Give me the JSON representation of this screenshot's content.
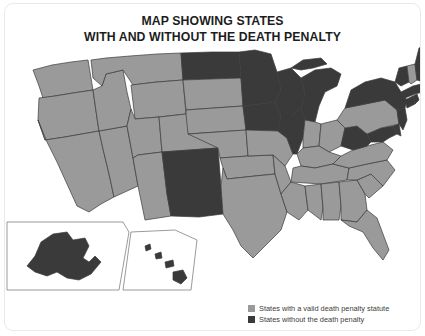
{
  "title": {
    "line1": "MAP SHOWING STATES",
    "line2": "WITH AND WITHOUT THE DEATH PENALTY"
  },
  "colors": {
    "with_penalty": "#9a9a9a",
    "without_penalty": "#3a3a3a",
    "border": "#3b3b3b",
    "background": "#ffffff",
    "card_border": "#e9e9ec",
    "text": "#1d1d1d",
    "legend_text": "#3c3c3c"
  },
  "legend": {
    "position": "bottom-right",
    "items": [
      {
        "swatch_color": "#9a9a9a",
        "label": "States with a valid death penalty statute",
        "category": "with_penalty"
      },
      {
        "swatch_color": "#3a3a3a",
        "label": "States without the death penalty",
        "category": "without_penalty"
      }
    ]
  },
  "chart_data": {
    "type": "map",
    "title": "MAP SHOWING STATES WITH AND WITHOUT THE DEATH PENALTY",
    "subtitle": "",
    "region": "United States",
    "projection": "albers-usa",
    "insets": [
      "Alaska",
      "Hawaii"
    ],
    "categories": [
      "States with a valid death penalty statute",
      "States without the death penalty"
    ],
    "category_colors": [
      "#9a9a9a",
      "#3a3a3a"
    ],
    "counts": {
      "with_penalty": 29,
      "without_penalty": 21
    },
    "states": [
      {
        "code": "AL",
        "name": "Alabama",
        "category": "with_penalty"
      },
      {
        "code": "AK",
        "name": "Alaska",
        "category": "without_penalty"
      },
      {
        "code": "AZ",
        "name": "Arizona",
        "category": "with_penalty"
      },
      {
        "code": "AR",
        "name": "Arkansas",
        "category": "with_penalty"
      },
      {
        "code": "CA",
        "name": "California",
        "category": "with_penalty"
      },
      {
        "code": "CO",
        "name": "Colorado",
        "category": "with_penalty"
      },
      {
        "code": "CT",
        "name": "Connecticut",
        "category": "without_penalty"
      },
      {
        "code": "DE",
        "name": "Delaware",
        "category": "without_penalty"
      },
      {
        "code": "FL",
        "name": "Florida",
        "category": "with_penalty"
      },
      {
        "code": "GA",
        "name": "Georgia",
        "category": "with_penalty"
      },
      {
        "code": "HI",
        "name": "Hawaii",
        "category": "without_penalty"
      },
      {
        "code": "ID",
        "name": "Idaho",
        "category": "with_penalty"
      },
      {
        "code": "IL",
        "name": "Illinois",
        "category": "without_penalty"
      },
      {
        "code": "IN",
        "name": "Indiana",
        "category": "with_penalty"
      },
      {
        "code": "IA",
        "name": "Iowa",
        "category": "without_penalty"
      },
      {
        "code": "KS",
        "name": "Kansas",
        "category": "with_penalty"
      },
      {
        "code": "KY",
        "name": "Kentucky",
        "category": "with_penalty"
      },
      {
        "code": "LA",
        "name": "Louisiana",
        "category": "with_penalty"
      },
      {
        "code": "ME",
        "name": "Maine",
        "category": "without_penalty"
      },
      {
        "code": "MD",
        "name": "Maryland",
        "category": "without_penalty"
      },
      {
        "code": "MA",
        "name": "Massachusetts",
        "category": "without_penalty"
      },
      {
        "code": "MI",
        "name": "Michigan",
        "category": "without_penalty"
      },
      {
        "code": "MN",
        "name": "Minnesota",
        "category": "without_penalty"
      },
      {
        "code": "MS",
        "name": "Mississippi",
        "category": "with_penalty"
      },
      {
        "code": "MO",
        "name": "Missouri",
        "category": "with_penalty"
      },
      {
        "code": "MT",
        "name": "Montana",
        "category": "with_penalty"
      },
      {
        "code": "NE",
        "name": "Nebraska",
        "category": "with_penalty"
      },
      {
        "code": "NV",
        "name": "Nevada",
        "category": "with_penalty"
      },
      {
        "code": "NH",
        "name": "New Hampshire",
        "category": "with_penalty"
      },
      {
        "code": "NJ",
        "name": "New Jersey",
        "category": "without_penalty"
      },
      {
        "code": "NM",
        "name": "New Mexico",
        "category": "without_penalty"
      },
      {
        "code": "NY",
        "name": "New York",
        "category": "without_penalty"
      },
      {
        "code": "NC",
        "name": "North Carolina",
        "category": "with_penalty"
      },
      {
        "code": "ND",
        "name": "North Dakota",
        "category": "without_penalty"
      },
      {
        "code": "OH",
        "name": "Ohio",
        "category": "with_penalty"
      },
      {
        "code": "OK",
        "name": "Oklahoma",
        "category": "with_penalty"
      },
      {
        "code": "OR",
        "name": "Oregon",
        "category": "with_penalty"
      },
      {
        "code": "PA",
        "name": "Pennsylvania",
        "category": "with_penalty"
      },
      {
        "code": "RI",
        "name": "Rhode Island",
        "category": "without_penalty"
      },
      {
        "code": "SC",
        "name": "South Carolina",
        "category": "with_penalty"
      },
      {
        "code": "SD",
        "name": "South Dakota",
        "category": "with_penalty"
      },
      {
        "code": "TN",
        "name": "Tennessee",
        "category": "with_penalty"
      },
      {
        "code": "TX",
        "name": "Texas",
        "category": "with_penalty"
      },
      {
        "code": "UT",
        "name": "Utah",
        "category": "with_penalty"
      },
      {
        "code": "VT",
        "name": "Vermont",
        "category": "without_penalty"
      },
      {
        "code": "VA",
        "name": "Virginia",
        "category": "with_penalty"
      },
      {
        "code": "WA",
        "name": "Washington",
        "category": "with_penalty"
      },
      {
        "code": "WV",
        "name": "West Virginia",
        "category": "without_penalty"
      },
      {
        "code": "WI",
        "name": "Wisconsin",
        "category": "without_penalty"
      },
      {
        "code": "WY",
        "name": "Wyoming",
        "category": "with_penalty"
      }
    ]
  }
}
